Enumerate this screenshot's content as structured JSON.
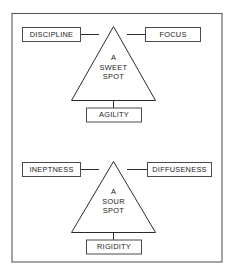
{
  "figure": {
    "kind": "concept-diagram",
    "border_color": "#555555",
    "line_color": "#2b2b2b",
    "box_fill": "#ffffff",
    "text_color": "#1a1a1a",
    "background": "#ffffff"
  },
  "panels": [
    {
      "id": "sweet-spot",
      "center_lines": [
        "A",
        "SWEET",
        "SPOT"
      ],
      "center_text": "A SWEET SPOT",
      "left_box": "DISCIPLINE",
      "right_box": "FOCUS",
      "bottom_box": "AGILITY",
      "shape": "triangle"
    },
    {
      "id": "sour-spot",
      "center_lines": [
        "A",
        "SOUR",
        "SPOT"
      ],
      "center_text": "A SOUR SPOT",
      "left_box": "INEPTNESS",
      "right_box": "DIFFUSENESS",
      "bottom_box": "RIGIDITY",
      "shape": "triangle"
    }
  ]
}
